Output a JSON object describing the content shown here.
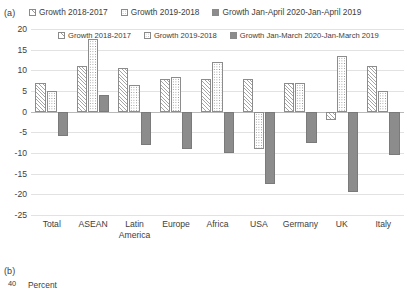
{
  "panel_a": {
    "tag": "(a)",
    "legend": [
      {
        "label": "Growth 2018-2017",
        "pattern": "diagonal-hatch"
      },
      {
        "label": "Growth 2019-2018",
        "pattern": "dotted"
      },
      {
        "label": "Growth Jan-April 2020-Jan-April 2019",
        "pattern": "solid-gray"
      }
    ]
  },
  "panel_b": {
    "tag": "(b)",
    "axis_value": "40",
    "axis_unit": "Percent",
    "legend": [
      {
        "label": "Growth 2018-2017",
        "pattern": "diagonal-hatch"
      },
      {
        "label": "Growth 2019-2018",
        "pattern": "dotted"
      },
      {
        "label": "Growth Jan-March 2020-Jan-March 2019",
        "pattern": "solid-gray"
      }
    ]
  },
  "chart_data": {
    "type": "bar",
    "title": "",
    "xlabel": "",
    "ylabel": "",
    "ylim": [
      -25,
      20
    ],
    "yticks": [
      20,
      15,
      10,
      5,
      0,
      -5,
      -10,
      -15,
      -20,
      -25
    ],
    "ytick_labels": [
      "20",
      "15",
      "10",
      "5",
      "0",
      "-5",
      "-10",
      "-15",
      "-20",
      "-25"
    ],
    "grid": true,
    "legend_position": "top",
    "categories": [
      "Total",
      "ASEAN",
      "Latin America",
      "Europe",
      "Africa",
      "USA",
      "Germany",
      "UK",
      "Italy"
    ],
    "category_labels": [
      [
        "Total"
      ],
      [
        "ASEAN"
      ],
      [
        "Latin",
        "America"
      ],
      [
        "Europe"
      ],
      [
        "Africa"
      ],
      [
        "USA"
      ],
      [
        "Germany"
      ],
      [
        "UK"
      ],
      [
        "Italy"
      ]
    ],
    "series": [
      {
        "name": "Growth 2018-2017",
        "pattern": "diagonal-hatch",
        "values": [
          7,
          11,
          10.5,
          8,
          8,
          8,
          7,
          -2,
          11
        ]
      },
      {
        "name": "Growth 2019-2018",
        "pattern": "dotted",
        "values": [
          5,
          17.5,
          6.5,
          8.5,
          12,
          -9,
          7,
          13.5,
          5
        ]
      },
      {
        "name": "Growth Jan-April 2020-Jan-April 2019",
        "pattern": "solid-gray",
        "values": [
          -6,
          4,
          -8,
          -9,
          -10,
          -17.5,
          -7.5,
          -19.5,
          -10.5
        ]
      }
    ]
  }
}
